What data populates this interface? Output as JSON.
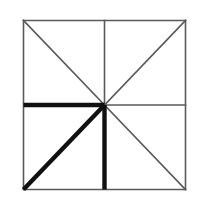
{
  "figure": {
    "background_color": "#ffffff",
    "canvas": {
      "width": 203,
      "height": 208
    },
    "square": {
      "left": 23.5,
      "top": 20.5,
      "right": 185.5,
      "bottom": 189.5,
      "stroke_color": "#5a5a5a",
      "stroke_width": 1.6
    },
    "center_point": {
      "x": 104.5,
      "y": 105.0
    },
    "thin_style": {
      "stroke_color": "#5a5a5a",
      "stroke_width": 1.6
    },
    "bold_style": {
      "stroke_color": "#111111",
      "stroke_width": 4.4
    },
    "border_segments": [
      {
        "name": "top-edge",
        "x1": 23.5,
        "y1": 20.5,
        "x2": 185.5,
        "y2": 20.5,
        "weight": "thin"
      },
      {
        "name": "right-edge",
        "x1": 185.5,
        "y1": 20.5,
        "x2": 185.5,
        "y2": 189.5,
        "weight": "thin"
      },
      {
        "name": "bottom-edge",
        "x1": 185.5,
        "y1": 189.5,
        "x2": 23.5,
        "y2": 189.5,
        "weight": "thin"
      },
      {
        "name": "left-edge",
        "x1": 23.5,
        "y1": 189.5,
        "x2": 23.5,
        "y2": 20.5,
        "weight": "thin"
      }
    ],
    "spokes": [
      {
        "name": "midline-up",
        "direction": "north",
        "x1": 104.5,
        "y1": 105.0,
        "x2": 104.5,
        "y2": 20.5,
        "weight": "thin"
      },
      {
        "name": "midline-right",
        "direction": "east",
        "x1": 104.5,
        "y1": 105.0,
        "x2": 185.5,
        "y2": 105.0,
        "weight": "thin"
      },
      {
        "name": "midline-down",
        "direction": "south",
        "x1": 104.5,
        "y1": 105.0,
        "x2": 104.5,
        "y2": 189.5,
        "weight": "bold"
      },
      {
        "name": "midline-left",
        "direction": "west",
        "x1": 104.5,
        "y1": 105.0,
        "x2": 23.5,
        "y2": 105.0,
        "weight": "bold"
      },
      {
        "name": "diagonal-up-left",
        "direction": "northwest",
        "x1": 104.5,
        "y1": 105.0,
        "x2": 23.5,
        "y2": 20.5,
        "weight": "thin"
      },
      {
        "name": "diagonal-up-right",
        "direction": "northeast",
        "x1": 104.5,
        "y1": 105.0,
        "x2": 185.5,
        "y2": 20.5,
        "weight": "thin"
      },
      {
        "name": "diagonal-down-right",
        "direction": "southeast",
        "x1": 104.5,
        "y1": 105.0,
        "x2": 185.5,
        "y2": 189.5,
        "weight": "thin"
      },
      {
        "name": "diagonal-down-left",
        "direction": "southwest",
        "x1": 104.5,
        "y1": 105.0,
        "x2": 23.5,
        "y2": 189.5,
        "weight": "bold"
      }
    ],
    "bold_spoke_names": [
      "midline-left",
      "diagonal-down-left",
      "midline-down"
    ],
    "bold_quadrant": "bottom-left"
  }
}
